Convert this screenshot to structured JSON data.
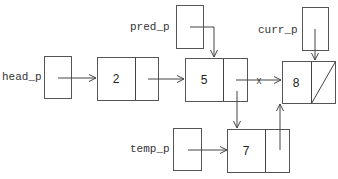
{
  "diagram": {
    "type": "linked-list-insertion",
    "pointers": [
      {
        "id": "head_p",
        "label": "head_p",
        "points_to": "node-2"
      },
      {
        "id": "pred_p",
        "label": "pred_p",
        "points_to": "node-5"
      },
      {
        "id": "curr_p",
        "label": "curr_p",
        "points_to": "node-8"
      },
      {
        "id": "temp_p",
        "label": "temp_p",
        "points_to": "node-7"
      }
    ],
    "nodes": [
      {
        "id": "node-2",
        "value": "2",
        "next": "node-5"
      },
      {
        "id": "node-5",
        "value": "5",
        "next": "node-7",
        "removed_link": "node-8"
      },
      {
        "id": "node-8",
        "value": "8",
        "next": null
      },
      {
        "id": "node-7",
        "value": "7",
        "next": "node-8"
      }
    ],
    "removed_link_mark": "x",
    "null_marker": "diagonal-slash"
  }
}
